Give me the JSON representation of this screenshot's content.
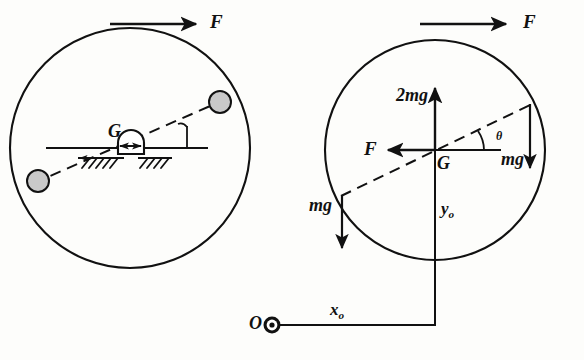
{
  "figure": {
    "background_color": "#fdfdfb",
    "ink_color": "#111111",
    "ball_fill": "#c9c9c9",
    "left_panel": {
      "name": "physical-setup",
      "circle": {
        "cx": 130,
        "cy": 148,
        "r": 120
      },
      "force_label_top": "F",
      "center_label": "G",
      "ball_upper": {
        "cx": 220,
        "cy": 102,
        "r": 11
      },
      "ball_lower": {
        "cx": 38,
        "cy": 181,
        "r": 11
      },
      "angle_arc_present": true,
      "support_hatching": true
    },
    "right_panel": {
      "name": "free-body-diagram",
      "circle": {
        "cx": 435,
        "cy": 150,
        "r": 110
      },
      "force_label_top": "F",
      "force_label_left": "F",
      "force_label_up": "2mg",
      "force_label_right_weight": "mg",
      "force_label_left_weight": "mg",
      "center_label": "G",
      "angle_label": "θ",
      "vertical_coord_label": "y",
      "vertical_coord_sub": "o",
      "horizontal_coord_label": "x",
      "horizontal_coord_sub": "o",
      "origin_label": "O",
      "origin_point": {
        "cx": 272,
        "cy": 325
      }
    }
  }
}
